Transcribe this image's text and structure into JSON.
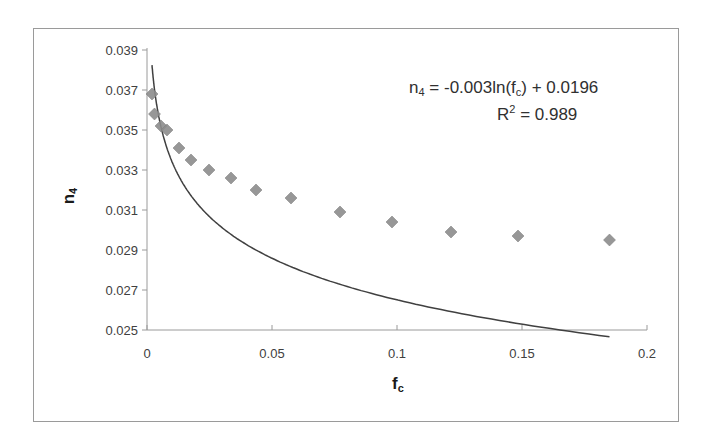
{
  "chart_data": {
    "type": "scatter",
    "title": "",
    "xlabel": "f",
    "xlabel_sub": "c",
    "ylabel": "n",
    "ylabel_sub": "4",
    "xlim": [
      0,
      0.2
    ],
    "ylim": [
      0.025,
      0.039
    ],
    "x_ticks": [
      "0",
      "0.05",
      "0.1",
      "0.15",
      "0.2"
    ],
    "y_ticks": [
      "0.025",
      "0.027",
      "0.029",
      "0.031",
      "0.033",
      "0.035",
      "0.037",
      "0.039"
    ],
    "grid": false,
    "legend": "none",
    "series": [
      {
        "name": "n4 data",
        "marker": "diamond",
        "color": "#8c8c8c",
        "x": [
          0.002,
          0.003,
          0.0056,
          0.008,
          0.0128,
          0.0176,
          0.0248,
          0.0336,
          0.0436,
          0.0576,
          0.0772,
          0.098,
          0.1216,
          0.1484,
          0.185
        ],
        "y": [
          0.0368,
          0.0358,
          0.0352,
          0.035,
          0.0341,
          0.0335,
          0.033,
          0.0326,
          0.032,
          0.0316,
          0.0309,
          0.0304,
          0.0299,
          0.0297,
          0.0295
        ]
      }
    ],
    "trendline": {
      "type": "logarithmic",
      "a": -0.003,
      "b": 0.0196,
      "color": "#404040"
    },
    "annotations": {
      "equation_prefix": "n",
      "equation_sub": "4",
      "equation_mid": " = -0.003ln(f",
      "equation_sub2": "c",
      "equation_suffix": ") + 0.0196",
      "r2_prefix": "R",
      "r2_sup": "2",
      "r2_suffix": " = 0.989"
    }
  }
}
